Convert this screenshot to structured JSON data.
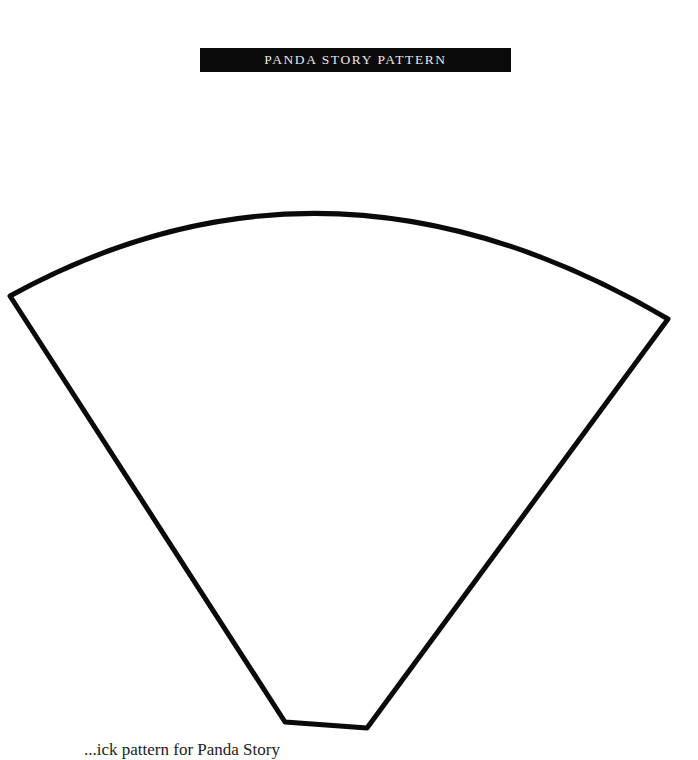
{
  "header": {
    "title": "PANDA STORY PATTERN"
  },
  "pattern": {
    "shape": "fan-segment",
    "stroke_color": "#0a0a0a"
  },
  "footer": {
    "caption": "...ick pattern for Panda Story"
  }
}
